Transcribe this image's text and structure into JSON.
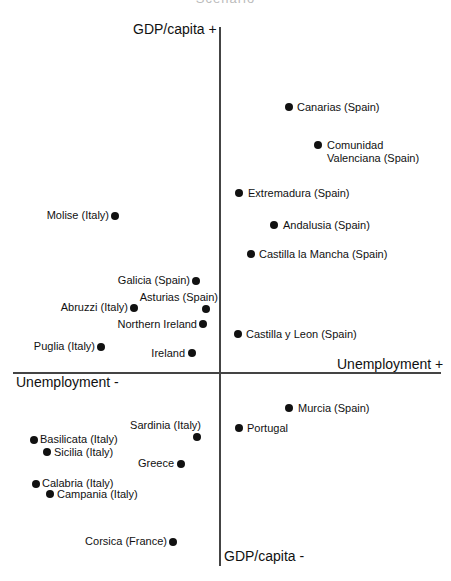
{
  "chart_data": {
    "type": "scatter",
    "title": "Scenario",
    "axes": {
      "y_positive_label": "GDP/capita +",
      "y_negative_label": "GDP/capita -",
      "x_positive_label": "Unemployment +",
      "x_negative_label": "Unemployment -"
    },
    "grid": false,
    "legend": null,
    "points": [
      {
        "name": "Canarias (Spain)",
        "px": 289,
        "py": 107,
        "lx": 297,
        "ly": 101,
        "align": "right"
      },
      {
        "name": "Comunidad\nValenciana (Spain)",
        "px": 318,
        "py": 145,
        "lx": 327,
        "ly": 139,
        "align": "right"
      },
      {
        "name": "Extremadura (Spain)",
        "px": 239,
        "py": 193,
        "lx": 248,
        "ly": 187,
        "align": "right"
      },
      {
        "name": "Andalusia (Spain)",
        "px": 274,
        "py": 225,
        "lx": 283,
        "ly": 219,
        "align": "right"
      },
      {
        "name": "Castilla la Mancha (Spain)",
        "px": 251,
        "py": 254,
        "lx": 259,
        "ly": 248,
        "align": "right"
      },
      {
        "name": "Molise (Italy)",
        "px": 115,
        "py": 216,
        "lx": 109,
        "ly": 209,
        "align": "left"
      },
      {
        "name": "Galicia (Spain)",
        "px": 196,
        "py": 281,
        "lx": 190,
        "ly": 274,
        "align": "left"
      },
      {
        "name": "Asturias (Spain)",
        "px": 206,
        "py": 309,
        "lx": 218,
        "ly": 291,
        "align": "left"
      },
      {
        "name": "Abruzzi (Italy)",
        "px": 134,
        "py": 308,
        "lx": 128,
        "ly": 301,
        "align": "left"
      },
      {
        "name": "Northern Ireland",
        "px": 203,
        "py": 324,
        "lx": 197,
        "ly": 318,
        "align": "left"
      },
      {
        "name": "Castilla y Leon (Spain)",
        "px": 238,
        "py": 334,
        "lx": 246,
        "ly": 328,
        "align": "right"
      },
      {
        "name": "Puglia (Italy)",
        "px": 101,
        "py": 347,
        "lx": 95,
        "ly": 340,
        "align": "left"
      },
      {
        "name": "Ireland",
        "px": 192,
        "py": 353,
        "lx": 185,
        "ly": 347,
        "align": "left"
      },
      {
        "name": "Murcia (Spain)",
        "px": 289,
        "py": 408,
        "lx": 298,
        "ly": 402,
        "align": "right"
      },
      {
        "name": "Portugal",
        "px": 239,
        "py": 428,
        "lx": 247,
        "ly": 422,
        "align": "right"
      },
      {
        "name": "Sardinia (Italy)",
        "px": 197,
        "py": 437,
        "lx": 201,
        "ly": 419,
        "align": "left"
      },
      {
        "name": "Basilicata (Italy)",
        "px": 34,
        "py": 440,
        "lx": 40,
        "ly": 433,
        "align": "right"
      },
      {
        "name": "Sicilia (Italy)",
        "px": 47,
        "py": 452,
        "lx": 54,
        "ly": 446,
        "align": "right"
      },
      {
        "name": "Greece",
        "px": 181,
        "py": 464,
        "lx": 174,
        "ly": 457,
        "align": "left"
      },
      {
        "name": "Calabria (Italy)",
        "px": 36,
        "py": 484,
        "lx": 42,
        "ly": 477,
        "align": "right"
      },
      {
        "name": "Campania (Italy)",
        "px": 50,
        "py": 494,
        "lx": 57,
        "ly": 488,
        "align": "right"
      },
      {
        "name": "Corsica (France)",
        "px": 173,
        "py": 542,
        "lx": 167,
        "ly": 535,
        "align": "left"
      }
    ]
  }
}
